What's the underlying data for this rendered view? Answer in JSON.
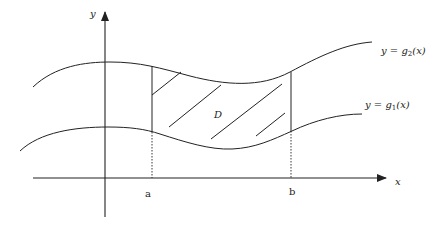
{
  "diagram": {
    "title": "",
    "axes": {
      "x_label": "x",
      "y_label": "y"
    },
    "curves": {
      "upper": {
        "label_prefix": "y = g",
        "subscript": "2",
        "label_suffix": "(x)"
      },
      "lower": {
        "label_prefix": "y = g",
        "subscript": "1",
        "label_suffix": "(x)"
      }
    },
    "bounds": {
      "a": "a",
      "b": "b"
    },
    "region_label": "D",
    "colors": {
      "stroke": "#222222",
      "background": "#ffffff"
    }
  }
}
